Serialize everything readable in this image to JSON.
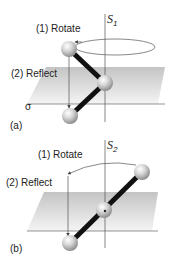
{
  "panels": [
    {
      "id": "a",
      "label": "(a)",
      "axis_symbol": "S",
      "axis_subscript": "1",
      "step1": "(1) Rotate",
      "step2": "(2) Reflect",
      "plane_label": "σ"
    },
    {
      "id": "b",
      "label": "(b)",
      "axis_symbol": "S",
      "axis_subscript": "2",
      "step1": "(1) Rotate",
      "step2": "(2) Reflect"
    }
  ],
  "colors": {
    "bond": "#111111",
    "atom_light": "#f2f2f2",
    "atom_dark": "#8c8c8c",
    "plane_light": "#ffffff",
    "plane_dark": "#bdbdbd",
    "line": "#555555"
  }
}
